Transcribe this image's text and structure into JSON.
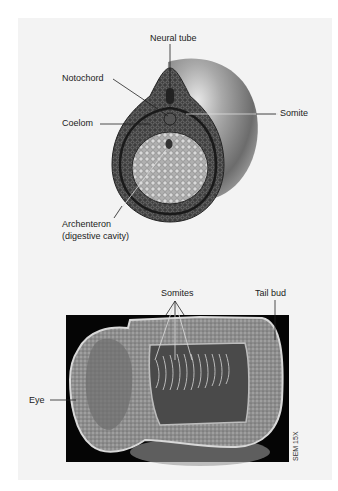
{
  "top_figure": {
    "title": "Embryo cross-section diagram",
    "labels": {
      "neural_tube": "Neural tube",
      "notochord": "Notochord",
      "coelom": "Coelom",
      "somite": "Somite",
      "archenteron_line1": "Archenteron",
      "archenteron_line2": "(digestive cavity)"
    }
  },
  "bottom_figure": {
    "title": "SEM micrograph of embryo",
    "labels": {
      "somites": "Somites",
      "tail_bud": "Tail bud",
      "eye": "Eye"
    },
    "magnification": "SEM 15X"
  },
  "colors": {
    "panel_bg": "#f3f3f3",
    "sem_bg": "#050505",
    "embryo_outer": "#3a3a3a",
    "yolk": "#bdbdbd",
    "sphere": "#8c8c8c"
  }
}
